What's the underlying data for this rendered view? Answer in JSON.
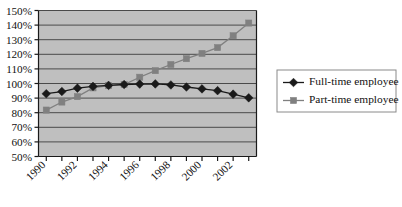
{
  "chart_data": {
    "type": "line",
    "title": "",
    "xlabel": "",
    "ylabel": "",
    "x": [
      1990,
      1991,
      1992,
      1993,
      1994,
      1995,
      1996,
      1997,
      1998,
      1999,
      2000,
      2001,
      2002,
      2003
    ],
    "categories": [
      "1990",
      "1991",
      "1992",
      "1993",
      "1994",
      "1995",
      "1996",
      "1997",
      "1998",
      "1999",
      "2000",
      "2001",
      "2002",
      "2003"
    ],
    "xtick_labels": [
      "1990",
      "",
      "1992",
      "",
      "1994",
      "",
      "1996",
      "",
      "1998",
      "",
      "2000",
      "",
      "2002",
      ""
    ],
    "ytick_labels": [
      "50%",
      "60%",
      "70%",
      "80%",
      "90%",
      "100%",
      "110%",
      "120%",
      "130%",
      "140%",
      "150%"
    ],
    "ytick_values": [
      50,
      60,
      70,
      80,
      90,
      100,
      110,
      120,
      130,
      140,
      150
    ],
    "ylim": [
      50,
      150
    ],
    "grid": true,
    "legend_position": "right",
    "series": [
      {
        "name": "Full-time employee",
        "marker": "diamond",
        "color": "#1a1a1a",
        "values": [
          93,
          94.5,
          96.8,
          98,
          98.7,
          99.3,
          99.6,
          99.7,
          99.0,
          97.6,
          96.3,
          95.1,
          92.7,
          90.2
        ]
      },
      {
        "name": "Part-time employee",
        "marker": "square",
        "color": "#808080",
        "values": [
          81.8,
          87.3,
          91.0,
          97.0,
          98.5,
          99.3,
          104.3,
          108.8,
          113.0,
          117.0,
          120.6,
          124.6,
          132.7,
          141.4
        ]
      }
    ],
    "colors": {
      "plot_background": "#bfbfbf",
      "gridline": "#4a4a4a",
      "axis": "#1a1a1a",
      "page_background": "#ffffff",
      "legend_border": "#8a8a8a",
      "full_time": "#1a1a1a",
      "part_time": "#808080"
    }
  },
  "legend": {
    "items": [
      {
        "label": "Full-time employee",
        "marker": "diamond",
        "color": "#1a1a1a"
      },
      {
        "label": "Part-time employee",
        "marker": "square",
        "color": "#808080"
      }
    ]
  }
}
